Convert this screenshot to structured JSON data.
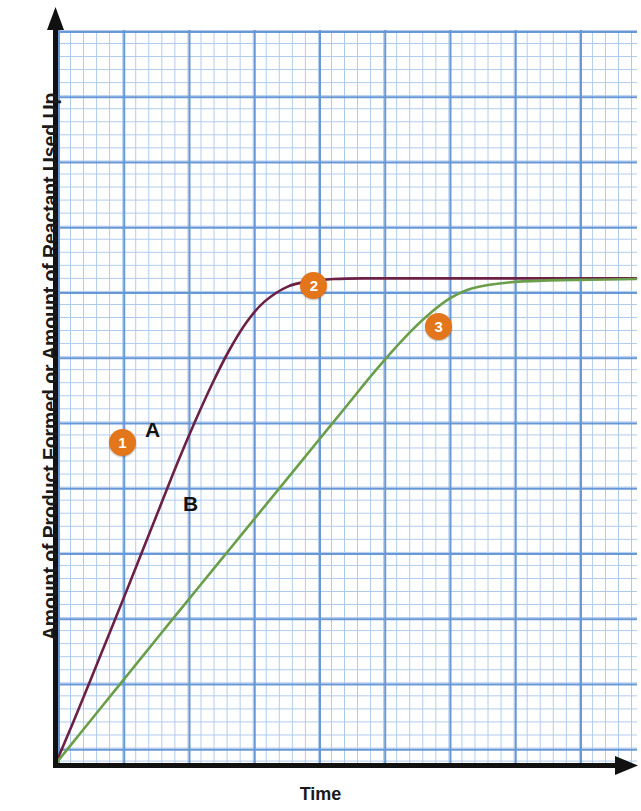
{
  "chart_data": {
    "type": "line",
    "title": "",
    "subtitle": "",
    "xlabel": "Time",
    "ylabel": "Amount of Product Formed or Amount of Reactant Used Up",
    "grid": true,
    "grid_style": "graph-paper",
    "legend_position": "inline-curve-labels",
    "xlim": [
      0,
      1
    ],
    "ylim": [
      0,
      1
    ],
    "x_tick_labels": [],
    "y_tick_labels": [],
    "axis_arrows": true,
    "series": [
      {
        "name": "A",
        "label": "A",
        "color": "#6B2044",
        "description": "Fast reaction: rises steeply, plateaus early",
        "x": [
          0.0,
          0.03,
          0.06,
          0.09,
          0.12,
          0.15,
          0.18,
          0.21,
          0.24,
          0.27,
          0.3,
          0.33,
          0.36,
          0.4,
          0.44,
          0.48,
          0.53,
          0.6,
          0.7,
          0.8,
          0.9,
          1.0
        ],
        "y": [
          0.0,
          0.06,
          0.122,
          0.185,
          0.248,
          0.312,
          0.376,
          0.44,
          0.5,
          0.556,
          0.606,
          0.647,
          0.676,
          0.698,
          0.706,
          0.709,
          0.71,
          0.71,
          0.71,
          0.71,
          0.71,
          0.71
        ]
      },
      {
        "name": "B",
        "label": "B",
        "color": "#6B9E4A",
        "description": "Slow reaction: rises gradually, reaches the same plateau later",
        "x": [
          0.0,
          0.04,
          0.08,
          0.12,
          0.16,
          0.2,
          0.25,
          0.3,
          0.35,
          0.4,
          0.45,
          0.5,
          0.55,
          0.6,
          0.64,
          0.68,
          0.72,
          0.78,
          0.85,
          0.92,
          1.0
        ],
        "y": [
          0.0,
          0.042,
          0.084,
          0.126,
          0.168,
          0.21,
          0.262,
          0.314,
          0.366,
          0.418,
          0.47,
          0.522,
          0.574,
          0.622,
          0.655,
          0.681,
          0.696,
          0.704,
          0.707,
          0.708,
          0.709
        ]
      }
    ],
    "annotations": [
      {
        "id": "1",
        "label": "1",
        "color": "#e3751b",
        "points_to": "curve-A-rising-region",
        "x": 0.115,
        "y": 0.47
      },
      {
        "id": "2",
        "label": "2",
        "color": "#e3751b",
        "points_to": "curve-A-plateau",
        "x": 0.445,
        "y": 0.7
      },
      {
        "id": "3",
        "label": "3",
        "color": "#e3751b",
        "points_to": "curve-B-reaches-plateau",
        "x": 0.66,
        "y": 0.64
      }
    ]
  },
  "axes": {
    "x_title": "Time",
    "y_title": "Amount of Product Formed or Amount of Reactant Used Up"
  },
  "curve_labels": {
    "a": "A",
    "b": "B"
  },
  "markers": {
    "one": "1",
    "two": "2",
    "three": "3"
  },
  "colors": {
    "curve_a": "#6B2044",
    "curve_b": "#6B9E4A",
    "marker": "#e3751b",
    "grid_fine": "#9fc0e8",
    "grid_major": "#5b8fd4",
    "axis": "#111111",
    "background": "#ffffff"
  }
}
